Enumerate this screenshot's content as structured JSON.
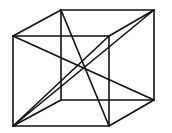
{
  "diagram": {
    "type": "wireframe-cube",
    "stroke_color": "#111111",
    "background": "#ffffff",
    "stroke_width": 1.6,
    "vertices": {
      "front_tl": [
        13,
        36
      ],
      "front_tr": [
        109,
        36
      ],
      "front_bl": [
        13,
        126
      ],
      "front_br": [
        109,
        126
      ],
      "back_tl": [
        61,
        10
      ],
      "back_tr": [
        154,
        10
      ],
      "back_bl": [
        61,
        100
      ],
      "back_br": [
        154,
        100
      ]
    },
    "edges": [
      [
        "front_tl",
        "front_tr"
      ],
      [
        "front_tr",
        "front_br"
      ],
      [
        "front_br",
        "front_bl"
      ],
      [
        "front_bl",
        "front_tl"
      ],
      [
        "back_tl",
        "back_tr"
      ],
      [
        "back_tr",
        "back_br"
      ],
      [
        "back_br",
        "back_bl"
      ],
      [
        "back_bl",
        "back_tl"
      ],
      [
        "front_tl",
        "back_tl"
      ],
      [
        "front_tr",
        "back_tr"
      ],
      [
        "front_bl",
        "back_bl"
      ],
      [
        "front_br",
        "back_br"
      ]
    ],
    "diagonals": [
      [
        "front_tl",
        "back_br"
      ],
      [
        "back_tl",
        "front_br"
      ],
      [
        "back_tr",
        "front_bl"
      ],
      [
        "front_bl",
        "front_tr"
      ]
    ]
  }
}
